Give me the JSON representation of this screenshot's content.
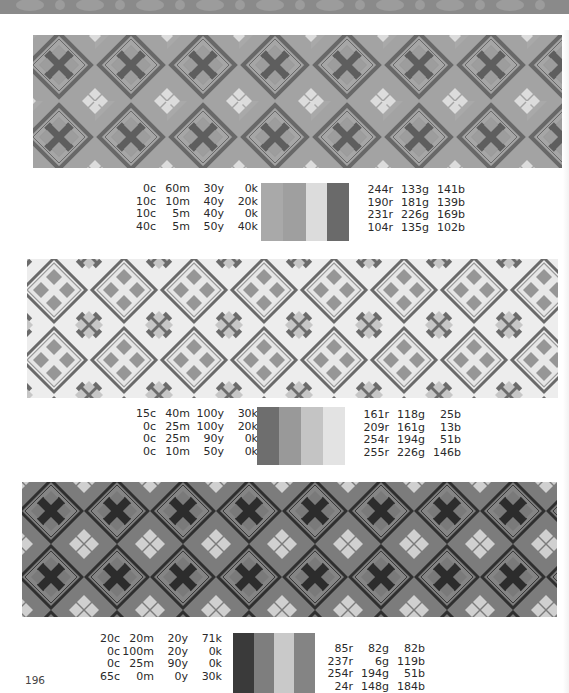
{
  "page": {
    "page_number": "196"
  },
  "sections": [
    {
      "name": "pattern-1",
      "cmyk": [
        [
          "0c",
          "60m",
          "30y",
          "0k"
        ],
        [
          "10c",
          "10m",
          "40y",
          "20k"
        ],
        [
          "10c",
          "5m",
          "40y",
          "0k"
        ],
        [
          "40c",
          "5m",
          "50y",
          "40k"
        ]
      ],
      "rgb": [
        [
          "244r",
          "133g",
          "141b"
        ],
        [
          "190r",
          "181g",
          "139b"
        ],
        [
          "231r",
          "226g",
          "169b"
        ],
        [
          "104r",
          "135g",
          "102b"
        ]
      ],
      "swatch_colors_rendered": [
        "#a9a9a9",
        "#9f9f9f",
        "#dcdcdc",
        "#6a6a6a"
      ],
      "swatch_colors_true": [
        "#f4858d",
        "#beb58b",
        "#e7e2a9",
        "#688766"
      ]
    },
    {
      "name": "pattern-2",
      "cmyk": [
        [
          "15c",
          "40m",
          "100y",
          "30k"
        ],
        [
          "0c",
          "25m",
          "100y",
          "20k"
        ],
        [
          "0c",
          "25m",
          "90y",
          "0k"
        ],
        [
          "0c",
          "10m",
          "50y",
          "0k"
        ]
      ],
      "rgb": [
        [
          "161r",
          "118g",
          "25b"
        ],
        [
          "209r",
          "161g",
          "13b"
        ],
        [
          "254r",
          "194g",
          "51b"
        ],
        [
          "255r",
          "226g",
          "146b"
        ]
      ],
      "swatch_colors_rendered": [
        "#6e6e6e",
        "#999999",
        "#c4c4c4",
        "#e3e3e3"
      ],
      "swatch_colors_true": [
        "#a17619",
        "#d1a10d",
        "#fec233",
        "#ffe292"
      ]
    },
    {
      "name": "pattern-3",
      "cmyk": [
        [
          "20c",
          "20m",
          "20y",
          "71k"
        ],
        [
          "0c",
          "100m",
          "20y",
          "0k"
        ],
        [
          "0c",
          "25m",
          "90y",
          "0k"
        ],
        [
          "65c",
          "0m",
          "0y",
          "30k"
        ]
      ],
      "rgb": [
        [
          "85r",
          "82g",
          "82b"
        ],
        [
          "237r",
          "6g",
          "119b"
        ],
        [
          "254r",
          "194g",
          "51b"
        ],
        [
          "24r",
          "148g",
          "184b"
        ]
      ],
      "swatch_colors_rendered": [
        "#3a3a3a",
        "#7e7e7e",
        "#c9c9c9",
        "#848484"
      ],
      "swatch_colors_true": [
        "#555252",
        "#ed0677",
        "#fec233",
        "#1894b8"
      ]
    }
  ]
}
